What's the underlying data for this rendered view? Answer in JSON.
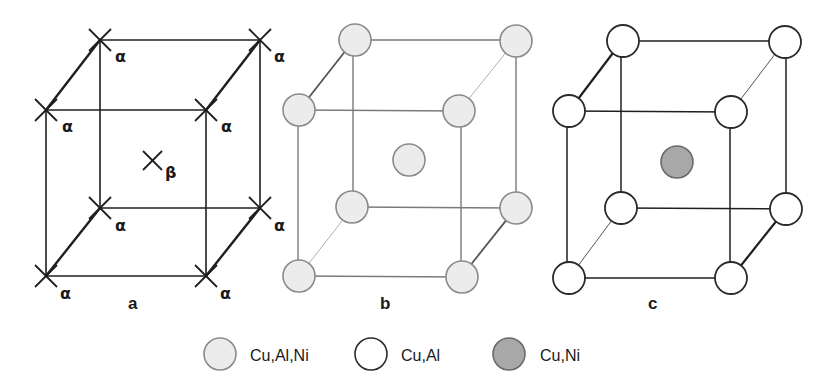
{
  "figure": {
    "panels": [
      {
        "id": "a",
        "label": "a",
        "corner_symbol": "×",
        "corner_site_label": "α",
        "center_site_label": "β",
        "corner_sites": 8,
        "center_sites": 1
      },
      {
        "id": "b",
        "label": "b",
        "corner_species": "Cu,Al,Ni",
        "center_species": "Cu,Al,Ni"
      },
      {
        "id": "c",
        "label": "c",
        "corner_species": "Cu,Al",
        "center_species": "Cu,Ni"
      }
    ],
    "legend": [
      {
        "label": "Cu,Al,Ni",
        "fill": "#ececec",
        "stroke": "#8a8a8a"
      },
      {
        "label": "Cu,Al",
        "fill": "#ffffff",
        "stroke": "#2a2a2a"
      },
      {
        "label": "Cu,Ni",
        "fill": "#a8a8a8",
        "stroke": "#6a6a6a"
      }
    ],
    "colors": {
      "line_dark": "#1f1f1f",
      "line_light": "#7a7a7a",
      "atom_light_fill": "#ececec",
      "atom_white_fill": "#ffffff",
      "atom_gray_fill": "#a8a8a8"
    }
  }
}
